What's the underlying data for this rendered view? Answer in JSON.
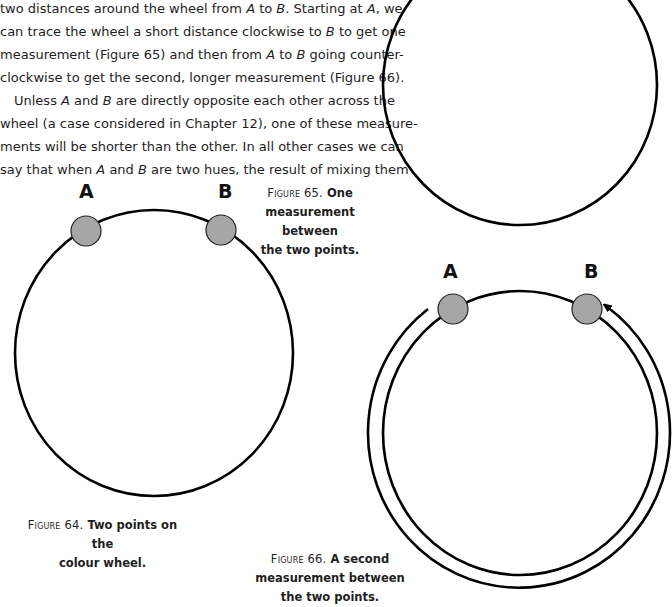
{
  "body_text": {
    "lines": [
      "two distances around the wheel from A to B. Starting at A, we",
      "can trace the wheel a short distance clockwise to B to get one",
      "measurement (Figure 65) and then from A to B going counter-",
      "clockwise to get the second, longer measurement (Figure 66).",
      "Unless A and B are directly opposite each other across the",
      "wheel (a case considered in Chapter 12), one of these measure-",
      "ments will be shorter than the other. In all other cases we can",
      "say that when A and B are two hues, the result of mixing them"
    ]
  },
  "figures": [
    {
      "id": "figure-64",
      "caption_prefix": "Figure 64.",
      "caption_lines": [
        "Two points on the",
        "colour wheel."
      ],
      "point_labels": [
        "A",
        "B"
      ]
    },
    {
      "id": "figure-65",
      "caption_prefix": "Figure 65.",
      "caption_lines": [
        "One",
        "measurement between",
        "the two points."
      ]
    },
    {
      "id": "figure-66",
      "caption_prefix": "Figure 66.",
      "caption_lines": [
        "A second",
        "measurement between",
        "the two points."
      ],
      "point_labels": [
        "A",
        "B"
      ]
    }
  ],
  "colors": {
    "point_fill": "#a6a6a6",
    "stroke": "#000000",
    "text": "#1e1e1e"
  }
}
